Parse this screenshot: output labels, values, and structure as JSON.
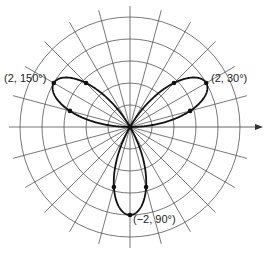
{
  "figure": {
    "type": "polar-graph",
    "equation": "r = 2 sin(3θ)",
    "center": [
      130,
      127
    ],
    "unit_px": 44,
    "ring_step": 0.5,
    "ring_count": 5,
    "spoke_step_deg": 15,
    "curve_color": "#111111",
    "grid_color": "#555555",
    "axis_arrow": "right"
  },
  "labels": [
    {
      "text": "(2, 150°)",
      "x": 4,
      "y": 78
    },
    {
      "text": "(2, 30°)",
      "x": 211,
      "y": 77
    },
    {
      "text": "(−2, 90°)",
      "x": 133,
      "y": 217
    }
  ],
  "points": [
    {
      "r": 2,
      "theta": 30
    },
    {
      "r": 2,
      "theta": 150
    },
    {
      "r": -2,
      "theta": 90
    },
    {
      "r": 1.414,
      "theta": 15
    },
    {
      "r": 1.414,
      "theta": 45
    },
    {
      "r": 1.414,
      "theta": 135
    },
    {
      "r": 1.414,
      "theta": 165
    },
    {
      "r": -1.414,
      "theta": 75
    },
    {
      "r": -1.414,
      "theta": 105
    }
  ]
}
